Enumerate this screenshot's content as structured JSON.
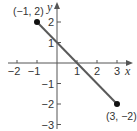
{
  "chart_data": {
    "type": "line",
    "title": "",
    "xlabel": "x",
    "ylabel": "y",
    "xlim": [
      -2.5,
      3.7
    ],
    "ylim": [
      -3.3,
      3
    ],
    "x_ticks": [
      -2,
      -1,
      1,
      2,
      3
    ],
    "x_tick_labels": [
      "−2",
      "−1",
      "1",
      "2",
      "3"
    ],
    "y_ticks": [
      -3,
      -2,
      -1,
      1,
      2
    ],
    "y_tick_labels": [
      "−3",
      "−2",
      "−1",
      "1",
      "2"
    ],
    "grid": false,
    "legend": null,
    "series": [
      {
        "name": "segment",
        "x": [
          -1,
          3
        ],
        "y": [
          2,
          -2
        ],
        "color": "#5a5a5a"
      }
    ],
    "points": [
      {
        "x": -1,
        "y": 2,
        "label": "(−1, 2)"
      },
      {
        "x": 3,
        "y": -2,
        "label": "(3, −2)"
      }
    ],
    "annotations": [
      "(−1, 2)",
      "(3, −2)"
    ]
  },
  "colors": {
    "axis": "#555555",
    "line": "#5a5a5a",
    "point": "#111111",
    "text": "#333333"
  }
}
